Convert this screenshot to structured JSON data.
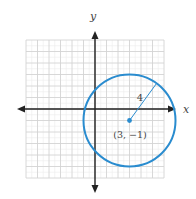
{
  "figure": {
    "axes": {
      "x_label": "x",
      "y_label": "y",
      "x_range": [
        -6,
        6
      ],
      "y_range": [
        -6,
        6
      ],
      "grid": true
    },
    "circle": {
      "center": [
        3,
        -1
      ],
      "radius": 4,
      "center_label": "(3, −1)",
      "radius_label": "4",
      "color": "#2a8ccf"
    },
    "colors": {
      "axis": "#222222",
      "grid": "#d4d4d4",
      "grid_minor": "#ececec",
      "text": "#444444"
    }
  }
}
